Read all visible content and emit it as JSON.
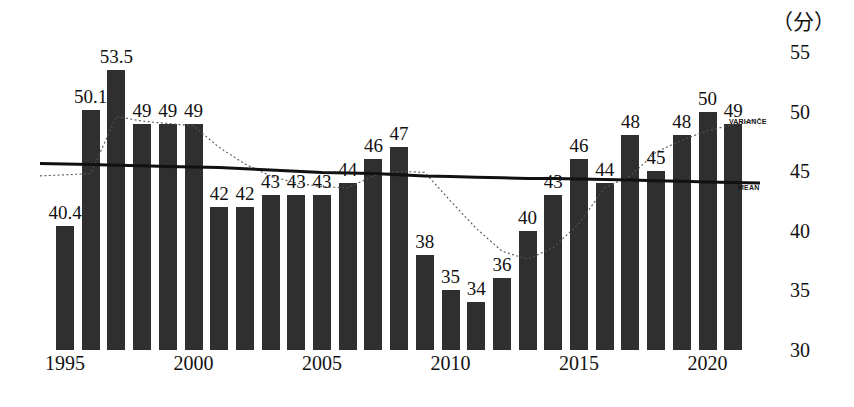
{
  "chart_data": {
    "type": "bar",
    "title": "",
    "subtitle": "",
    "xlabel": "",
    "ylabel": "",
    "unit_label": "（分）",
    "ylim": [
      30,
      55
    ],
    "y_ticks": [
      30,
      35,
      40,
      45,
      50,
      55
    ],
    "grid": false,
    "legend_position": "inline-right",
    "x": [
      1995,
      1996,
      1997,
      1998,
      1999,
      2000,
      2001,
      2002,
      2003,
      2004,
      2005,
      2006,
      2007,
      2008,
      2009,
      2010,
      2011,
      2012,
      2013,
      2014,
      2015,
      2016,
      2017,
      2018,
      2019,
      2020,
      2021
    ],
    "categories": [
      "1995",
      "1996",
      "1997",
      "1998",
      "1999",
      "2000",
      "2001",
      "2002",
      "2003",
      "2004",
      "2005",
      "2006",
      "2007",
      "2008",
      "2009",
      "2010",
      "2011",
      "2012",
      "2013",
      "2014",
      "2015",
      "2016",
      "2017",
      "2018",
      "2019",
      "2020",
      "2021"
    ],
    "x_tick_labels": [
      "1995",
      "2000",
      "2005",
      "2010",
      "2015",
      "2020"
    ],
    "x_tick_positions": [
      1995,
      2000,
      2005,
      2010,
      2015,
      2020
    ],
    "values": [
      40.4,
      50.1,
      53.5,
      49,
      49,
      49,
      42,
      42,
      43,
      43,
      43,
      44,
      46,
      47,
      38,
      35,
      34,
      36,
      40,
      43,
      46,
      44,
      48,
      45,
      48,
      50,
      49
    ],
    "bar_labels": [
      "40.4",
      "50.1",
      "53.5",
      "49",
      "49",
      "49",
      "42",
      "42",
      "43",
      "43",
      "43",
      "44",
      "46",
      "47",
      "38",
      "35",
      "34",
      "36",
      "40",
      "43",
      "46",
      "44",
      "48",
      "45",
      "48",
      "50",
      "49"
    ],
    "series": [
      {
        "name": "bars",
        "label": "",
        "kind": "bar",
        "color": "#2f2f2f",
        "values": [
          40.4,
          50.1,
          53.5,
          49,
          49,
          49,
          42,
          42,
          43,
          43,
          43,
          44,
          46,
          47,
          38,
          35,
          34,
          36,
          40,
          43,
          46,
          44,
          48,
          45,
          48,
          50,
          49
        ]
      },
      {
        "name": "mean",
        "label": "MEAN",
        "kind": "line",
        "style": "solid",
        "color": "#111111",
        "values": [
          45.6,
          45.55,
          45.5,
          45.45,
          45.4,
          45.35,
          45.3,
          45.2,
          45.1,
          45.0,
          44.9,
          44.85,
          44.8,
          44.7,
          44.6,
          44.55,
          44.5,
          44.45,
          44.4,
          44.38,
          44.35,
          44.3,
          44.25,
          44.2,
          44.15,
          44.1,
          44.05
        ]
      },
      {
        "name": "variance",
        "label": "VARIANCE",
        "kind": "line",
        "style": "dotted",
        "color": "#555555",
        "values": [
          44.7,
          44.8,
          49.6,
          49.2,
          49.0,
          48.8,
          47.0,
          45.6,
          44.6,
          44.0,
          43.7,
          43.6,
          44.6,
          45.0,
          44.9,
          42.5,
          40.2,
          38.3,
          37.6,
          38.6,
          40.6,
          43.6,
          44.6,
          46.6,
          47.6,
          48.4,
          48.9
        ]
      }
    ]
  },
  "axis": {
    "y_tick_labels": [
      "55",
      "50",
      "45",
      "40",
      "35",
      "30"
    ],
    "unit": "（分）"
  },
  "annotations": {
    "mean_label": "MEAN",
    "variance_label": "VARIANCE"
  },
  "colors": {
    "bar": "#2f2f2f",
    "mean_line": "#111111",
    "variance_line": "#555555",
    "background": "#ffffff",
    "text": "#111111"
  }
}
